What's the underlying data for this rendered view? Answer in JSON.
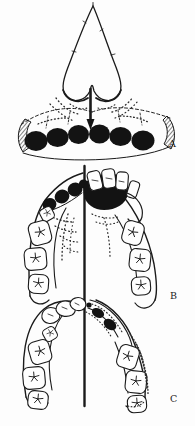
{
  "figure": {
    "background_color": "#fdfdfd",
    "ink_color": "#1a1a1a",
    "panels": [
      {
        "label": "A"
      },
      {
        "label": "B"
      },
      {
        "label": "C"
      }
    ]
  }
}
